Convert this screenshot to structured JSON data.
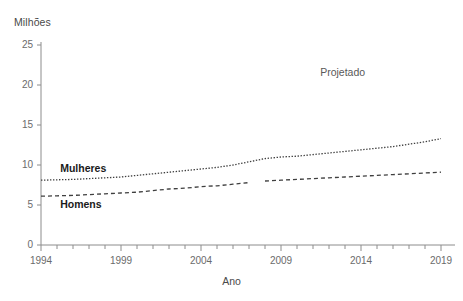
{
  "chart_data": {
    "type": "line",
    "title": "",
    "xlabel": "Ano",
    "ylabel": "Milhões",
    "xlim": [
      1994,
      2019
    ],
    "ylim": [
      0,
      25
    ],
    "grid": false,
    "legend_position": "inline",
    "x_tick_labels": [
      "1994",
      "1999",
      "2004",
      "2009",
      "2014",
      "2019"
    ],
    "x_tick_values": [
      1994,
      1999,
      2004,
      2009,
      2014,
      2019
    ],
    "y_tick_labels": [
      "0",
      "5",
      "10",
      "15",
      "20",
      "25"
    ],
    "y_tick_values": [
      0,
      5,
      10,
      15,
      20,
      25
    ],
    "x_minor_tick_step": 1,
    "annotations": [
      {
        "text": "Projetado",
        "x": 2014.2,
        "y": 21.6
      }
    ],
    "x": [
      1994,
      1995,
      1996,
      1997,
      1998,
      1999,
      2000,
      2001,
      2002,
      2003,
      2004,
      2005,
      2006,
      2007,
      2008,
      2009,
      2010,
      2011,
      2012,
      2013,
      2014,
      2015,
      2016,
      2017,
      2018,
      2019
    ],
    "series": [
      {
        "name": "Mulheres",
        "style": "dotted",
        "color": "#3f3f3f",
        "values": [
          8.1,
          8.15,
          8.2,
          8.3,
          8.4,
          8.5,
          8.7,
          8.9,
          9.1,
          9.3,
          9.5,
          9.7,
          10.0,
          10.4,
          10.8,
          11.0,
          11.1,
          11.3,
          11.5,
          11.7,
          11.9,
          12.1,
          12.3,
          12.6,
          12.9,
          13.3
        ],
        "label_x": 1995.2,
        "label_y": 9.6
      },
      {
        "name": "Homens",
        "style": "dashed",
        "color": "#3f3f3f",
        "values": [
          6.1,
          6.15,
          6.2,
          6.3,
          6.4,
          6.5,
          6.6,
          6.8,
          7.0,
          7.1,
          7.3,
          7.4,
          7.6,
          7.8,
          8.0,
          8.1,
          8.2,
          8.3,
          8.4,
          8.5,
          8.6,
          8.7,
          8.8,
          8.9,
          9.0,
          9.1
        ],
        "break_after_index": 13,
        "label_x": 1995.2,
        "label_y": 5.1
      }
    ]
  }
}
